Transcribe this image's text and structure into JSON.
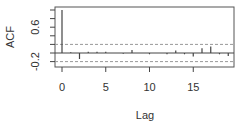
{
  "chart_data": {
    "type": "bar",
    "title": "",
    "xlabel": "Lag",
    "ylabel": "ACF",
    "x": [
      0,
      1,
      2,
      3,
      4,
      5,
      6,
      7,
      8,
      9,
      10,
      11,
      12,
      13,
      14,
      15,
      16,
      17,
      18,
      19
    ],
    "values": [
      1.0,
      0.02,
      -0.14,
      0.03,
      0.03,
      0.03,
      0.0,
      -0.02,
      0.07,
      0.0,
      -0.03,
      0.0,
      -0.03,
      0.06,
      -0.03,
      -0.08,
      0.11,
      0.15,
      -0.03,
      -0.07
    ],
    "confidence_band": [
      -0.2,
      0.2
    ],
    "xticks": [
      "0",
      "5",
      "10",
      "15"
    ],
    "yticks": [
      "-0.2",
      "0.6"
    ],
    "xlim": [
      -0.5,
      19.5
    ],
    "ylim": [
      -0.25,
      1.05
    ],
    "grid": false,
    "legend": null
  }
}
